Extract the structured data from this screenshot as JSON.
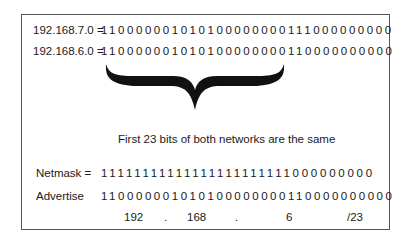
{
  "rows": [
    {
      "label": "192.168.7.0 =",
      "bits": "110000001010100000000111000000000"
    },
    {
      "label": "192.168.6.0 =",
      "bits": "110000001010100000000110000000000"
    }
  ],
  "caption": "First 23 bits of both networks are the same",
  "netmask": {
    "label": "Netmask =",
    "bits": "11111111111111111111111000000000"
  },
  "advertise": {
    "label": "Advertise",
    "bits": "110000001010100000000110000000000"
  },
  "result": {
    "octet1": "192",
    "dot1": ".",
    "octet2": "168",
    "dot2": ".",
    "octet3": "6",
    "prefix": "/23"
  }
}
